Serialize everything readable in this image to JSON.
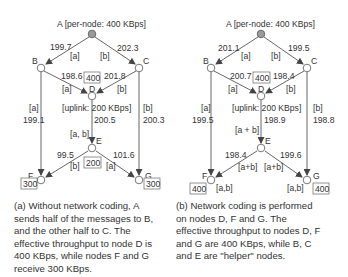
{
  "colors": {
    "line": "#555555",
    "source_node": "#9a9a9a",
    "text": "#333333"
  },
  "diagram_a": {
    "source_label": "A [per-node: 400 KBps]",
    "nodes": {
      "A": "A",
      "B": "B",
      "C": "C",
      "D": "D",
      "E": "E",
      "F": "F",
      "G": "G"
    },
    "edges": {
      "AB": {
        "rate": "199.7",
        "msg": "[a]"
      },
      "AC": {
        "rate": "202.3",
        "msg": "[b]"
      },
      "BD": {
        "rate": "198.6",
        "msg": "[a]"
      },
      "CD": {
        "rate": "201.8",
        "msg": "[b]"
      },
      "BF": {
        "rate": "199.1",
        "msg": "[a]"
      },
      "CG": {
        "rate": "200.3",
        "msg": "[b]"
      },
      "DE": {
        "rate": "200.5",
        "msg": "[a, b]"
      },
      "EF": {
        "rate": "99.5",
        "msg": "[b]"
      },
      "EG": {
        "rate": "101.6",
        "msg": "[a]"
      }
    },
    "uplink_label": "[uplink: 200 KBps]",
    "throughput": {
      "D": "400",
      "E": "200",
      "F": "300",
      "G": "300"
    },
    "caption": [
      "(a) Without network coding, A",
      "sends half of the messages to B,",
      "and the other half to C.  The",
      "effective throughput to node D is",
      "400 KBps, while nodes F and G",
      "receive 300 KBps."
    ]
  },
  "diagram_b": {
    "source_label": "A [per-node: 400 KBps]",
    "nodes": {
      "A": "A",
      "B": "B",
      "C": "C",
      "D": "D",
      "E": "E",
      "F": "F",
      "G": "G"
    },
    "edges": {
      "AB": {
        "rate": "201.1",
        "msg": "[a]"
      },
      "AC": {
        "rate": "199.5",
        "msg": "[b]"
      },
      "BD": {
        "rate": "200.7",
        "msg": "[a]"
      },
      "CD": {
        "rate": "198.4",
        "msg": "[b]"
      },
      "BF": {
        "rate": "199.5",
        "msg": "[a]"
      },
      "CG": {
        "rate": "198.8",
        "msg": "[b]"
      },
      "DE": {
        "rate": "198.9",
        "msg": "[a + b]"
      },
      "EF": {
        "rate": "198.4",
        "msg": "[a+b]"
      },
      "EG": {
        "rate": "199.6",
        "msg": "[a+b]"
      }
    },
    "uplink_label": "[uplink: 200 KBps]",
    "throughput": {
      "D": "400",
      "F": "400",
      "G": "400"
    },
    "decoded": {
      "F": "[a,b]",
      "G": "[a,b]"
    },
    "caption": [
      "(b) Network coding is performed",
      "on nodes D, F and G.  The",
      "effective throughput to nodes D, F",
      "and G are 400 KBps, while B, C",
      "and E are \"helper\" nodes."
    ]
  }
}
